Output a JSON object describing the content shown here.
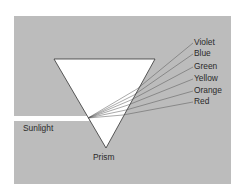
{
  "figure": {
    "panel_color": "#bcbcbc",
    "prism_label": "Prism",
    "beam_label": "Sunlight",
    "spectrum": [
      {
        "name": "Violet",
        "y": 43
      },
      {
        "name": "Blue",
        "y": 54
      },
      {
        "name": "Green",
        "y": 67
      },
      {
        "name": "Yellow",
        "y": 79
      },
      {
        "name": "Orange",
        "y": 91
      },
      {
        "name": "Red",
        "y": 102
      }
    ]
  }
}
